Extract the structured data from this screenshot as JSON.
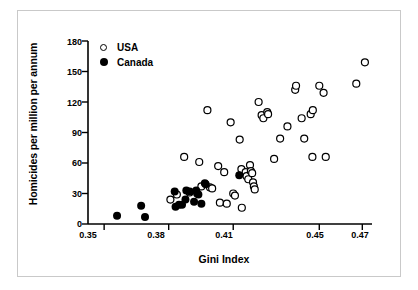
{
  "chart_data": {
    "type": "scatter",
    "title": "",
    "xlabel": "Gini Index",
    "ylabel": "Homicides per million per annum",
    "xlim": [
      0.3425,
      0.4745
    ],
    "ylim": [
      0,
      180
    ],
    "xticks": [
      0.35,
      0.38,
      0.41,
      0.45,
      0.47
    ],
    "xtick_labels": [
      "0.35",
      "0.38",
      "0.41",
      "0.45",
      "0.47"
    ],
    "yticks": [
      0,
      30,
      60,
      90,
      120,
      150,
      180
    ],
    "ytick_labels": [
      "0",
      "30",
      "60",
      "90",
      "120",
      "150",
      "180"
    ],
    "grid": false,
    "legend_position": "top-left",
    "marker_colors": {
      "usa": "#ffffff",
      "usa_edge": "#000000",
      "canada": "#000000"
    },
    "frame_color": "#c9c9c9",
    "axis_color": "#000000",
    "series": [
      {
        "name": "USA",
        "marker": "open-circle",
        "points": [
          [
            0.3808,
            24
          ],
          [
            0.3838,
            29
          ],
          [
            0.3872,
            66
          ],
          [
            0.3897,
            31
          ],
          [
            0.3942,
            61
          ],
          [
            0.3952,
            37
          ],
          [
            0.398,
            112
          ],
          [
            0.3992,
            36
          ],
          [
            0.4002,
            35
          ],
          [
            0.403,
            57
          ],
          [
            0.4038,
            21
          ],
          [
            0.4058,
            51
          ],
          [
            0.407,
            20
          ],
          [
            0.4088,
            100
          ],
          [
            0.41,
            30
          ],
          [
            0.4108,
            28
          ],
          [
            0.413,
            83
          ],
          [
            0.4138,
            54
          ],
          [
            0.414,
            16
          ],
          [
            0.4158,
            51
          ],
          [
            0.4162,
            47
          ],
          [
            0.417,
            44
          ],
          [
            0.4178,
            58
          ],
          [
            0.4182,
            52
          ],
          [
            0.4188,
            50
          ],
          [
            0.4192,
            41
          ],
          [
            0.4196,
            37
          ],
          [
            0.42,
            34
          ],
          [
            0.4218,
            120
          ],
          [
            0.4232,
            107
          ],
          [
            0.424,
            104
          ],
          [
            0.4258,
            110
          ],
          [
            0.4262,
            108
          ],
          [
            0.429,
            64
          ],
          [
            0.4318,
            84
          ],
          [
            0.4352,
            96
          ],
          [
            0.4388,
            132
          ],
          [
            0.4392,
            136
          ],
          [
            0.4418,
            104
          ],
          [
            0.443,
            84
          ],
          [
            0.446,
            108
          ],
          [
            0.4468,
            66
          ],
          [
            0.447,
            112
          ],
          [
            0.45,
            136
          ],
          [
            0.452,
            129
          ],
          [
            0.453,
            66
          ],
          [
            0.4672,
            138
          ],
          [
            0.4712,
            159
          ]
        ]
      },
      {
        "name": "Canada",
        "marker": "filled-circle",
        "points": [
          [
            0.356,
            8
          ],
          [
            0.3672,
            18
          ],
          [
            0.369,
            7
          ],
          [
            0.3828,
            32
          ],
          [
            0.3832,
            17
          ],
          [
            0.3848,
            19
          ],
          [
            0.3862,
            19
          ],
          [
            0.3878,
            24
          ],
          [
            0.3882,
            33
          ],
          [
            0.3898,
            32
          ],
          [
            0.3918,
            22
          ],
          [
            0.3928,
            33
          ],
          [
            0.3932,
            30
          ],
          [
            0.3938,
            29
          ],
          [
            0.3952,
            20
          ],
          [
            0.3968,
            40
          ],
          [
            0.3972,
            39
          ],
          [
            0.4128,
            48
          ]
        ]
      }
    ]
  },
  "legend": {
    "items": [
      {
        "label": "USA",
        "marker": "open-circle"
      },
      {
        "label": "Canada",
        "marker": "filled-circle"
      }
    ]
  }
}
